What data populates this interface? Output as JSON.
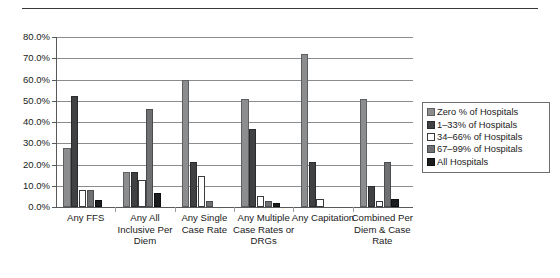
{
  "figure": {
    "top_rule": "horizontal-rule"
  },
  "chart_data": {
    "type": "bar",
    "title": "",
    "xlabel": "",
    "ylabel": "",
    "ylim": [
      0,
      80
    ],
    "ytick_labels": [
      "0.0%",
      "10.0%",
      "20.0%",
      "30.0%",
      "40.0%",
      "50.0%",
      "60.0%",
      "70.0%",
      "80.0%"
    ],
    "ytick_values": [
      0,
      10,
      20,
      30,
      40,
      50,
      60,
      70,
      80
    ],
    "grid": true,
    "legend_position": "right",
    "categories": [
      "Any FFS",
      "Any All Inclusive Per Diem",
      "Any Single Case Rate",
      "Any Multiple Case Rates or DRGs",
      "Any Capitation",
      "Combined Per Diem & Case Rate"
    ],
    "series": [
      {
        "name": "Zero % of Hospitals",
        "values": [
          27.8,
          16.6,
          60.0,
          51.0,
          72.0,
          51.0
        ]
      },
      {
        "name": "1–33% of Hospitals",
        "values": [
          52.4,
          16.5,
          21.0,
          36.8,
          21.0,
          10.0
        ]
      },
      {
        "name": "34–66% of Hospitals",
        "values": [
          8.0,
          12.6,
          14.5,
          5.0,
          3.8,
          3.0
        ]
      },
      {
        "name": "67–99% of Hospitals",
        "values": [
          8.0,
          46.0,
          3.0,
          3.0,
          0.0,
          21.0
        ]
      },
      {
        "name": "All Hospitals",
        "values": [
          3.2,
          6.5,
          0.0,
          2.0,
          0.0,
          4.0
        ]
      }
    ]
  },
  "legend": {
    "items": [
      {
        "label": "Zero % of Hospitals",
        "color": "#8b8d8f"
      },
      {
        "label": "1–33% of Hospitals",
        "color": "#3f4142"
      },
      {
        "label": "34–66% of Hospitals",
        "color": "#ffffff"
      },
      {
        "label": "67–99% of Hospitals",
        "color": "#6e7072"
      },
      {
        "label": "All Hospitals",
        "color": "#1c1d1e"
      }
    ]
  }
}
